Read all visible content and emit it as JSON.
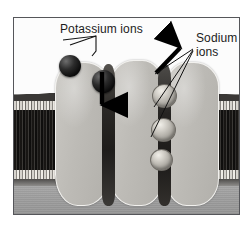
{
  "figure": {
    "frame_border_color": "#55565a",
    "background_color": "#ffffff"
  },
  "labels": {
    "potassium": {
      "text": "Potassium ions",
      "color": "#1b1b1b"
    },
    "sodium": {
      "line1": "Sodium",
      "line2": "ions",
      "color": "#1b1b1b"
    }
  },
  "regions": {
    "extracellular": {
      "name": "extracellular-space",
      "color": "#fcfcfc"
    },
    "membrane": {
      "name": "lipid-bilayer",
      "color": "#201e1c",
      "head_color": "#d6d3cd"
    },
    "cytoplasm": {
      "name": "cytoplasm",
      "color": "#9e9e9e"
    }
  },
  "proteins": [
    {
      "name": "channel-protein-left",
      "color": "#bdbbb6"
    },
    {
      "name": "channel-protein-middle",
      "color": "#bdbbb6"
    },
    {
      "name": "channel-protein-right",
      "color": "#bdbbb6"
    }
  ],
  "ions": {
    "potassium": {
      "color": "#0c0c0c",
      "count": 2,
      "items": [
        {
          "name": "potassium-ion-outside"
        },
        {
          "name": "potassium-ion-entering-channel"
        }
      ]
    },
    "sodium": {
      "color": "#cfccc5",
      "count": 3,
      "items": [
        {
          "name": "sodium-ion-top"
        },
        {
          "name": "sodium-ion-middle"
        },
        {
          "name": "sodium-ion-bottom"
        }
      ]
    }
  },
  "arrows": {
    "potassium_influx": {
      "name": "potassium-downward-arrow",
      "direction": "down",
      "color": "#000000"
    },
    "sodium_efflux": {
      "name": "sodium-upward-arrow",
      "direction": "up-right",
      "color": "#000000"
    }
  },
  "leader_lines": {
    "potassium": {
      "name": "potassium-leader-line",
      "color": "#111111"
    },
    "sodium": {
      "name": "sodium-leader-lines",
      "color": "#111111",
      "count": 3
    }
  }
}
